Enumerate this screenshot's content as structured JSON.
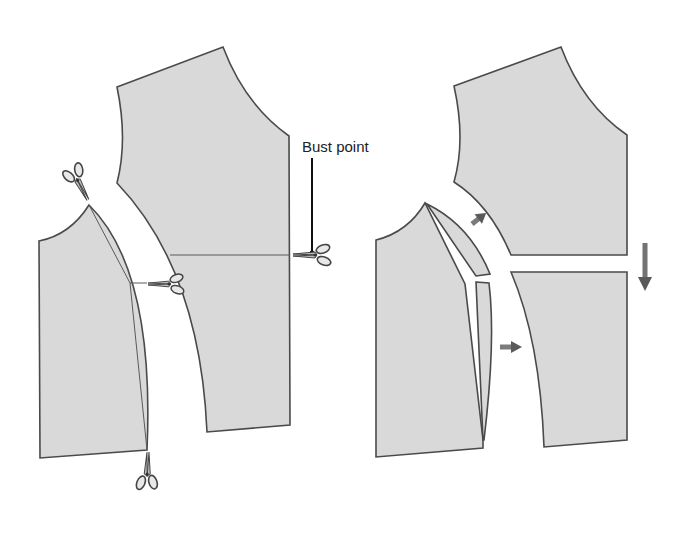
{
  "diagram": {
    "label_bust_point": "Bust point",
    "colors": {
      "fabric": "#d9d9d9",
      "outline": "#4a4a4a",
      "arrow": "#5a5a5a",
      "background": "#ffffff"
    },
    "panels": [
      {
        "name": "before",
        "description": "Original bodice pieces with cutting lines",
        "pieces": [
          "center-front-piece",
          "side-front-piece"
        ],
        "scissors": [
          "side-neck-cut",
          "dart-cut",
          "bust-line-cut",
          "hem-cut"
        ]
      },
      {
        "name": "after",
        "description": "Pieces separated and spread",
        "pieces": [
          "upper-center-piece",
          "lower-center-piece",
          "side-piece",
          "side-upper-strip",
          "side-lower-strip"
        ],
        "arrows": [
          "up-right",
          "right",
          "down"
        ]
      }
    ]
  }
}
